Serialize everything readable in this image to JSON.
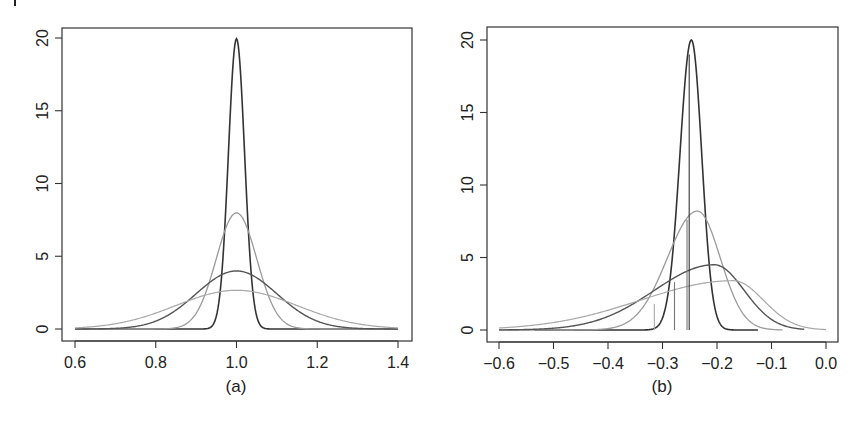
{
  "chart_data": [
    {
      "type": "line",
      "panel_label": "(a)",
      "title": "",
      "xlabel": "(a)",
      "ylabel": "",
      "xlim": [
        0.6,
        1.4
      ],
      "ylim": [
        0,
        20
      ],
      "xticks": [
        0.6,
        0.8,
        1.0,
        1.2,
        1.4
      ],
      "xtick_labels": [
        "0.6",
        "0.8",
        "1.0",
        "1.2",
        "1.4"
      ],
      "yticks": [
        0,
        5,
        10,
        15,
        20
      ],
      "ytick_labels": [
        "0",
        "5",
        "10",
        "15",
        "20"
      ],
      "grid": false,
      "legend": null,
      "series": [
        {
          "name": "density 1",
          "kind": "normal",
          "mean": 1.0,
          "peak": 19.95,
          "sd": 0.02,
          "xrange": [
            0.6,
            1.4
          ],
          "color": "#333333",
          "width": 1.6
        },
        {
          "name": "density 2",
          "kind": "normal",
          "mean": 1.0,
          "peak": 7.98,
          "sd": 0.05,
          "xrange": [
            0.6,
            1.4
          ],
          "color": "#9a9a9a",
          "width": 1.3
        },
        {
          "name": "density 3",
          "kind": "normal",
          "mean": 1.0,
          "peak": 3.99,
          "sd": 0.1,
          "xrange": [
            0.6,
            1.4
          ],
          "color": "#555555",
          "width": 1.4
        },
        {
          "name": "density 4",
          "kind": "normal",
          "mean": 1.0,
          "peak": 2.66,
          "sd": 0.15,
          "xrange": [
            0.6,
            1.4
          ],
          "color": "#a8a8a8",
          "width": 1.2
        }
      ]
    },
    {
      "type": "line",
      "panel_label": "(b)",
      "title": "",
      "xlabel": "(b)",
      "ylabel": "",
      "xlim": [
        -0.6,
        0.0
      ],
      "ylim": [
        0,
        20
      ],
      "xticks": [
        -0.6,
        -0.5,
        -0.4,
        -0.3,
        -0.2,
        -0.1,
        0.0
      ],
      "xtick_labels": [
        "−0.6",
        "−0.5",
        "−0.4",
        "−0.3",
        "−0.2",
        "−0.1",
        "0.0"
      ],
      "yticks": [
        0,
        5,
        10,
        15,
        20
      ],
      "ytick_labels": [
        "0",
        "5",
        "10",
        "15",
        "20"
      ],
      "grid": false,
      "legend": null,
      "series": [
        {
          "name": "density 1",
          "kind": "skew",
          "mode": -0.247,
          "peak": 20.0,
          "sd_left": 0.021,
          "sd_right": 0.019,
          "xrange": [
            -0.535,
            -0.125
          ],
          "color": "#333333",
          "width": 1.6
        },
        {
          "name": "density 2",
          "kind": "skew",
          "mode": -0.236,
          "peak": 8.2,
          "sd_left": 0.055,
          "sd_right": 0.042,
          "xrange": [
            -0.6,
            -0.08
          ],
          "color": "#9a9a9a",
          "width": 1.3
        },
        {
          "name": "density 3",
          "kind": "skew",
          "mode": -0.205,
          "peak": 4.5,
          "sd_left": 0.11,
          "sd_right": 0.055,
          "xrange": [
            -0.6,
            -0.04
          ],
          "color": "#555555",
          "width": 1.4
        },
        {
          "name": "density 4",
          "kind": "skew",
          "mode": -0.17,
          "peak": 3.4,
          "sd_left": 0.17,
          "sd_right": 0.055,
          "xrange": [
            -0.6,
            0.0
          ],
          "color": "#a8a8a8",
          "width": 1.2
        }
      ],
      "vertical_lines": [
        {
          "x": -0.315,
          "y_top": 1.8,
          "color": "#a8a8a8"
        },
        {
          "x": -0.278,
          "y_top": 3.3,
          "color": "#777777"
        },
        {
          "x": -0.255,
          "y_top": 7.6,
          "color": "#777777"
        },
        {
          "x": -0.251,
          "y_top": 19.0,
          "color": "#333333"
        }
      ]
    }
  ],
  "panels": {
    "a": {
      "caption": "(a)"
    },
    "b": {
      "caption": "(b)"
    }
  }
}
